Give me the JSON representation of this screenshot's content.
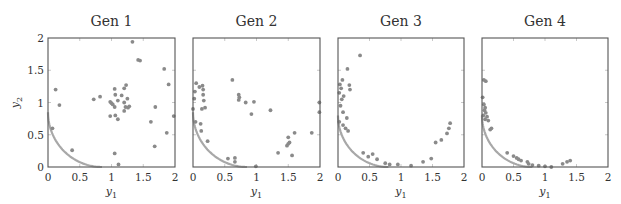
{
  "figure": {
    "ylabel": "y2",
    "xlabel": "y1"
  },
  "chart_data": [
    {
      "type": "scatter",
      "title": "Gen 1",
      "xlabel": "y1",
      "ylabel": "y2",
      "xlim": [
        0,
        2
      ],
      "ylim": [
        0,
        2
      ],
      "xticks": [
        "0",
        "0.5",
        "1",
        "1.5",
        "2"
      ],
      "yticks": [
        "0",
        "0.5",
        "1",
        "1.5",
        "2"
      ],
      "grid": false,
      "front_radius": 0.85,
      "points": [
        [
          1.33,
          1.94
        ],
        [
          1.42,
          1.66
        ],
        [
          1.45,
          1.65
        ],
        [
          1.83,
          1.52
        ],
        [
          1.9,
          1.28
        ],
        [
          0.12,
          1.2
        ],
        [
          0.18,
          0.96
        ],
        [
          0.72,
          1.05
        ],
        [
          0.82,
          1.09
        ],
        [
          1.05,
          1.21
        ],
        [
          1.06,
          1.12
        ],
        [
          1.16,
          1.11
        ],
        [
          1.2,
          1.22
        ],
        [
          1.23,
          1.27
        ],
        [
          0.98,
          1.01
        ],
        [
          1.0,
          0.99
        ],
        [
          1.02,
          0.97
        ],
        [
          1.1,
          1.03
        ],
        [
          1.2,
          1.0
        ],
        [
          1.25,
          1.06
        ],
        [
          1.05,
          0.93
        ],
        [
          1.22,
          0.93
        ],
        [
          1.26,
          0.92
        ],
        [
          1.28,
          0.94
        ],
        [
          1.2,
          0.87
        ],
        [
          0.98,
          0.79
        ],
        [
          1.06,
          0.8
        ],
        [
          1.1,
          0.74
        ],
        [
          1.69,
          0.93
        ],
        [
          1.62,
          0.7
        ],
        [
          1.98,
          0.79
        ],
        [
          1.87,
          0.53
        ],
        [
          1.68,
          0.32
        ],
        [
          1.05,
          0.21
        ],
        [
          1.11,
          0.04
        ],
        [
          0.38,
          0.26
        ],
        [
          0.07,
          0.6
        ]
      ]
    },
    {
      "type": "scatter",
      "title": "Gen 2",
      "xlabel": "y1",
      "ylabel": "",
      "xlim": [
        0,
        2
      ],
      "ylim": [
        0,
        2
      ],
      "xticks": [
        "0",
        "0.5",
        "1",
        "1.5",
        "2"
      ],
      "yticks": [],
      "grid": false,
      "front_radius": 0.85,
      "points": [
        [
          0.05,
          1.3
        ],
        [
          0.1,
          1.24
        ],
        [
          0.15,
          1.26
        ],
        [
          0.16,
          1.2
        ],
        [
          0.03,
          1.17
        ],
        [
          0.02,
          1.06
        ],
        [
          0.16,
          1.12
        ],
        [
          0.17,
          1.03
        ],
        [
          0.19,
          0.92
        ],
        [
          0.14,
          0.9
        ],
        [
          0.0,
          0.9
        ],
        [
          0.04,
          0.7
        ],
        [
          0.12,
          0.67
        ],
        [
          0.13,
          0.56
        ],
        [
          0.23,
          0.4
        ],
        [
          0.62,
          1.35
        ],
        [
          0.72,
          1.12
        ],
        [
          0.73,
          1.08
        ],
        [
          0.72,
          1.04
        ],
        [
          0.83,
          1.0
        ],
        [
          0.96,
          1.01
        ],
        [
          0.92,
          0.82
        ],
        [
          1.22,
          0.88
        ],
        [
          1.99,
          1.0
        ],
        [
          1.99,
          0.85
        ],
        [
          1.6,
          0.53
        ],
        [
          1.87,
          0.53
        ],
        [
          1.5,
          0.46
        ],
        [
          1.52,
          0.38
        ],
        [
          1.5,
          0.36
        ],
        [
          1.48,
          0.33
        ],
        [
          1.34,
          0.22
        ],
        [
          1.56,
          0.18
        ],
        [
          0.55,
          0.13
        ],
        [
          0.66,
          0.14
        ],
        [
          0.66,
          0.08
        ],
        [
          0.99,
          0.01
        ]
      ]
    },
    {
      "type": "scatter",
      "title": "Gen 3",
      "xlabel": "y1",
      "ylabel": "",
      "xlim": [
        0,
        2
      ],
      "ylim": [
        0,
        2
      ],
      "xticks": [
        "0",
        "0.5",
        "1",
        "1.5",
        "2"
      ],
      "yticks": [],
      "grid": false,
      "front_radius": 0.8,
      "points": [
        [
          0.35,
          1.73
        ],
        [
          0.15,
          1.52
        ],
        [
          0.07,
          1.35
        ],
        [
          0.03,
          1.28
        ],
        [
          0.18,
          1.27
        ],
        [
          0.19,
          1.2
        ],
        [
          0.05,
          1.22
        ],
        [
          0.02,
          1.15
        ],
        [
          0.09,
          1.1
        ],
        [
          0.06,
          1.05
        ],
        [
          0.04,
          0.95
        ],
        [
          0.08,
          0.85
        ],
        [
          0.14,
          0.76
        ],
        [
          0.02,
          0.7
        ],
        [
          0.08,
          0.65
        ],
        [
          0.12,
          0.6
        ],
        [
          0.16,
          0.56
        ],
        [
          0.4,
          0.22
        ],
        [
          0.55,
          0.2
        ],
        [
          0.48,
          0.16
        ],
        [
          0.62,
          0.12
        ],
        [
          0.75,
          0.06
        ],
        [
          0.82,
          0.04
        ],
        [
          0.95,
          0.04
        ],
        [
          1.16,
          0.02
        ],
        [
          1.35,
          0.08
        ],
        [
          1.48,
          0.13
        ],
        [
          1.55,
          0.38
        ],
        [
          1.64,
          0.42
        ],
        [
          1.73,
          0.52
        ],
        [
          1.76,
          0.6
        ],
        [
          1.78,
          0.68
        ]
      ]
    },
    {
      "type": "scatter",
      "title": "Gen 4",
      "xlabel": "y1",
      "ylabel": "",
      "xlim": [
        0,
        2
      ],
      "ylim": [
        0,
        2
      ],
      "xticks": [
        "0",
        "0.5",
        "1",
        "1.5",
        "2"
      ],
      "yticks": [],
      "grid": false,
      "front_radius": 0.8,
      "points": [
        [
          0.06,
          1.33
        ],
        [
          0.03,
          1.35
        ],
        [
          0.01,
          1.08
        ],
        [
          0.03,
          0.97
        ],
        [
          0.05,
          0.92
        ],
        [
          0.04,
          0.88
        ],
        [
          0.06,
          0.84
        ],
        [
          0.02,
          0.8
        ],
        [
          0.08,
          0.78
        ],
        [
          0.05,
          0.74
        ],
        [
          0.1,
          0.72
        ],
        [
          0.15,
          0.6
        ],
        [
          0.13,
          0.58
        ],
        [
          0.4,
          0.22
        ],
        [
          0.5,
          0.17
        ],
        [
          0.55,
          0.14
        ],
        [
          0.58,
          0.12
        ],
        [
          0.62,
          0.1
        ],
        [
          0.72,
          0.08
        ],
        [
          0.74,
          0.05
        ],
        [
          0.8,
          0.03
        ],
        [
          0.9,
          0.02
        ],
        [
          1.0,
          0.01
        ],
        [
          1.1,
          0.0
        ],
        [
          1.28,
          0.05
        ],
        [
          1.35,
          0.08
        ],
        [
          1.4,
          0.1
        ]
      ]
    }
  ]
}
